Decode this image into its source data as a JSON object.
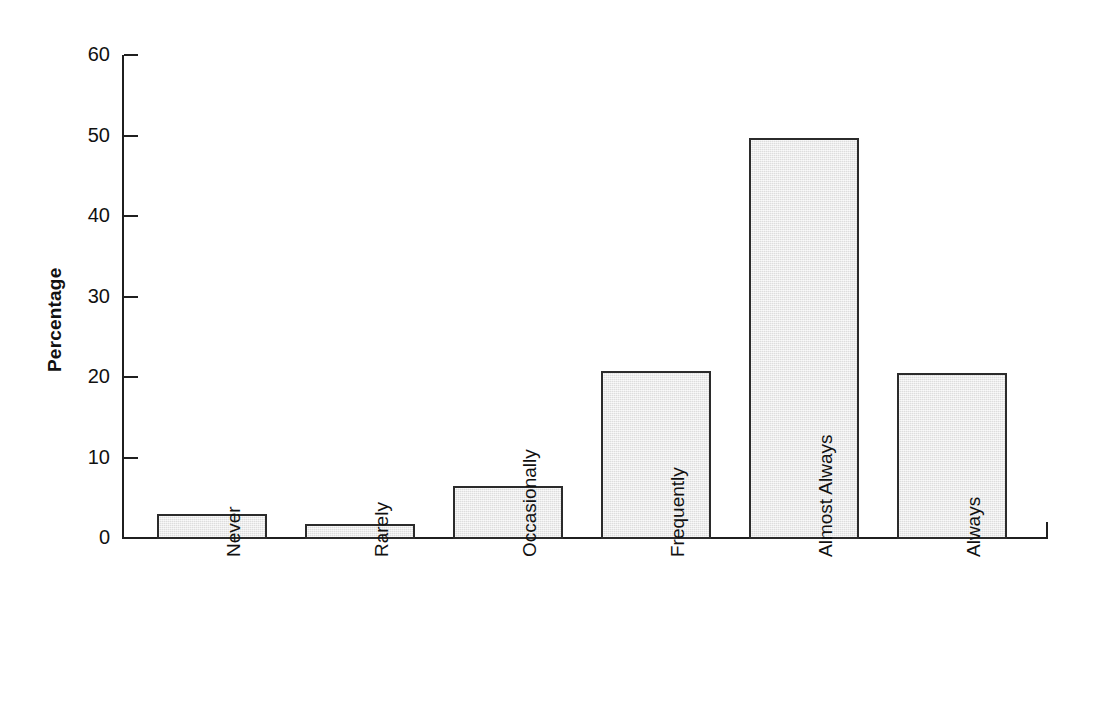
{
  "chart_data": {
    "type": "bar",
    "title": "",
    "xlabel": "",
    "ylabel": "Percentage",
    "categories": [
      "Never",
      "Rarely",
      "Occasionally",
      "Frequently",
      "Almost Always",
      "Always"
    ],
    "values": [
      3.1,
      1.9,
      6.6,
      20.9,
      49.8,
      20.6
    ],
    "ylim": [
      0,
      60
    ],
    "yticks": [
      0,
      10,
      20,
      30,
      40,
      50,
      60
    ],
    "ytick_labels": [
      "0",
      "10",
      "20",
      "30",
      "40",
      "50",
      "60"
    ],
    "grid": false,
    "legend": null,
    "bar_fill_color": "#e6e6e6",
    "bar_edge_color": "#2b2b2b",
    "axis_color": "#1f1f1f",
    "background_color": "#ffffff"
  }
}
